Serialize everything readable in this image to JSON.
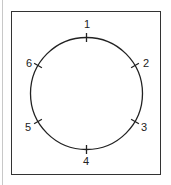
{
  "diagram": {
    "type": "circle-with-numbered-positions",
    "stroke_color": "#222222",
    "positions": [
      {
        "label": "1",
        "angle_deg": 0
      },
      {
        "label": "2",
        "angle_deg": 60
      },
      {
        "label": "3",
        "angle_deg": 120
      },
      {
        "label": "4",
        "angle_deg": 180
      },
      {
        "label": "5",
        "angle_deg": 240
      },
      {
        "label": "6",
        "angle_deg": 300
      }
    ]
  }
}
